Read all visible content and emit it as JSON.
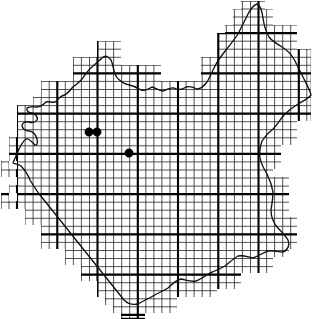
{
  "figure": {
    "kind": "distribution-dot-map",
    "title": "",
    "caption": "",
    "width": 312,
    "height": 319,
    "background_color": "#ffffff"
  },
  "chart_data": {
    "type": "scatter",
    "title": "",
    "subtitle": "",
    "xlabel": "",
    "ylabel": "",
    "legend": [],
    "annotations": [],
    "grid": true,
    "axis_visible": false,
    "tick_labels": [],
    "series": [
      {
        "name": "occurrence-records",
        "marker": "filled-circle",
        "marker_color": "#000000",
        "marker_radius_px": 4.2,
        "count": 3,
        "points": [
          {
            "id": "record-1",
            "x": 89,
            "y": 132
          },
          {
            "id": "record-2",
            "x": 97,
            "y": 132
          },
          {
            "id": "record-3",
            "x": 129,
            "y": 153
          }
        ]
      }
    ],
    "grid_spec": {
      "fine_cell_px": 8.05,
      "major_every_n_cells": 5,
      "major_cell_px": 40.25,
      "origin_x_px": 17.2,
      "origin_y_px": 32.4,
      "fine_line_color": "#1a1a1a",
      "major_line_color": "#000000"
    }
  },
  "geometry": {
    "region_outline_path": "M 13 159 L 18 152 L 21 144 L 26 139 L 31 141 L 35 146 L 38 141 L 36 133 L 32 130 L 28 131 L 24 129 L 21 124 L 26 121 L 31 124 L 36 122 L 38 117 L 34 113 L 29 113 L 25 110 L 29 106 L 35 108 L 41 106 L 45 102 L 50 104 L 55 101 L 58 96 L 63 96 L 68 93 L 72 87 L 78 84 L 82 78 L 86 72 L 91 68 L 95 64 L 99 61 L 102 57 L 106 55 L 110 58 L 112 63 L 113 69 L 115 74 L 118 79 L 122 82 L 127 84 L 132 85 L 137 88 L 142 90 L 147 89 L 151 86 L 155 89 L 160 91 L 165 89 L 169 86 L 174 88 L 179 90 L 184 88 L 188 85 L 193 87 L 198 89 L 202 86 L 206 82 L 209 77 L 212 72 L 215 66 L 219 61 L 223 56 L 228 52 L 232 47 L 236 42 L 240 36 L 243 30 L 246 24 L 249 18 L 252 12 L 255 7 L 258 4 L 261 7 L 263 13 L 264 20 L 265 27 L 267 33 L 270 38 L 274 42 L 279 45 L 284 48 L 289 52 L 293 57 L 296 63 L 299 69 L 302 75 L 305 81 L 308 87 L 311 93 L 308 98 L 303 101 L 298 103 L 293 106 L 288 110 L 284 114 L 280 119 L 277 124 L 273 128 L 269 131 L 265 135 L 262 140 L 260 146 L 259 152 L 260 158 L 262 164 L 265 169 L 268 174 L 271 179 L 273 185 L 274 191 L 274 197 L 273 203 L 272 209 L 272 215 L 274 221 L 277 226 L 281 230 L 285 234 L 288 239 L 290 245 L 288 250 L 283 252 L 278 251 L 273 250 L 268 251 L 263 253 L 258 256 L 253 258 L 248 257 L 243 255 L 238 256 L 234 259 L 230 263 L 226 266 L 221 268 L 216 270 L 211 272 L 206 275 L 202 279 L 197 281 L 192 282 L 187 281 L 182 279 L 177 280 L 173 284 L 169 288 L 164 291 L 159 293 L 154 295 L 149 298 L 144 301 L 139 303 L 134 305 L 129 304 L 125 300 L 121 296 L 117 291 L 113 286 L 109 281 L 105 276 L 101 271 L 97 266 L 93 261 L 89 256 L 85 251 L 81 246 L 77 241 L 73 236 L 69 231 L 65 226 L 61 221 L 57 216 L 53 211 L 49 206 L 45 201 L 41 196 L 37 191 L 33 186 L 30 181 L 28 175 L 25 170 L 21 166 L 16 163 Z",
    "grid_clip_cells_note": "Grid is clipped to a stepped polygon that approximates the region outline at one fine-cell resolution."
  },
  "accessibility": {
    "alt_text": "Black and white distribution map: an irregular region boundary drawn as a thin wavy line, overlaid by a fine square grid clipped in a stepped pattern to the boundary, with heavier grid lines every fifth cell. Three solid black dots mark records in the west-central interior."
  }
}
